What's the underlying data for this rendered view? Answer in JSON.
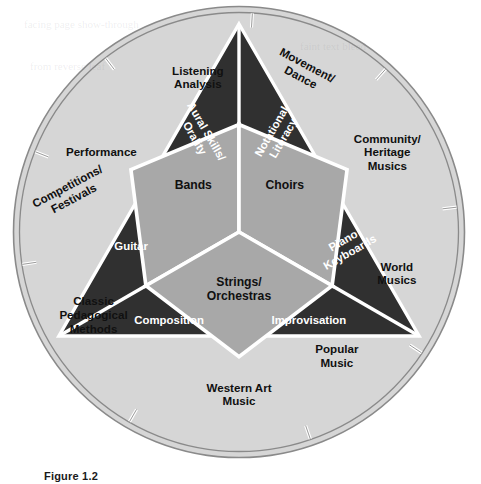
{
  "figure": {
    "caption": "Figure 1.2",
    "colors": {
      "outer_ring": "#d6d6d6",
      "inner_triangle": "#303030",
      "center": "#a8a8a8",
      "divider": "#ffffff",
      "rim": "#8a8a8a",
      "text_dark": "#101010",
      "text_light": "#ffffff",
      "background": "#ffffff"
    },
    "geometry": {
      "center_x": 239,
      "center_y": 232,
      "outer_radius": 227,
      "ring_inner_radius": 219,
      "triangle_radius": 208,
      "core_radius": 96
    },
    "outer_ring": {
      "name": "outer-ring",
      "segments": [
        {
          "id": "performance",
          "label": "Performance",
          "lines": [
            "Performance"
          ],
          "rotation": 0,
          "label_r": 0.7,
          "angle": -60
        },
        {
          "id": "listening-analysis",
          "label": "Listening Analysis",
          "lines": [
            "Listening",
            "Analysis"
          ],
          "rotation": 0,
          "label_r": 0.7,
          "angle": -15
        },
        {
          "id": "movement-dance",
          "label": "Movement/ Dance",
          "lines": [
            "Movement/",
            "Dance"
          ],
          "rotation": 28,
          "label_r": 0.76,
          "angle": 22
        },
        {
          "id": "community-heritage",
          "label": "Community/ Heritage Musics",
          "lines": [
            "Community/",
            "Heritage",
            "Musics"
          ],
          "rotation": 0,
          "label_r": 0.74,
          "angle": 62
        },
        {
          "id": "world-musics",
          "label": "World Musics",
          "lines": [
            "World",
            "Musics"
          ],
          "rotation": 0,
          "label_r": 0.72,
          "angle": 105
        },
        {
          "id": "popular-music",
          "label": "Popular Music",
          "lines": [
            "Popular",
            "Music"
          ],
          "rotation": 0,
          "label_r": 0.7,
          "angle": 142
        },
        {
          "id": "western-art-music",
          "label": "Western Art Music",
          "lines": [
            "Western Art",
            "Music"
          ],
          "rotation": 0,
          "label_r": 0.72,
          "angle": 180
        },
        {
          "id": "classic-pedagogy",
          "label": "Classic Pedagogical Methods",
          "lines": [
            "Classic",
            "Pedagogical",
            "Methods"
          ],
          "rotation": 0,
          "label_r": 0.74,
          "angle": 240
        },
        {
          "id": "competitions",
          "label": "Competitions/ Festivals",
          "lines": [
            "Competitions/",
            "Festivals"
          ],
          "rotation": -28,
          "label_r": 0.76,
          "angle": 283
        }
      ]
    },
    "inner_triangle": {
      "name": "inner-triangle",
      "segments": [
        {
          "id": "aural-skills-orality",
          "label": "Aural Skills/ Orality",
          "lines": [
            "Aural Skills/",
            "Orality"
          ],
          "rotation": 60
        },
        {
          "id": "notational-literacy",
          "label": "Notational Literacy",
          "lines": [
            "Notational",
            "Literacy"
          ],
          "rotation": -60
        },
        {
          "id": "piano-keyboards",
          "label": "Piano Keyboards",
          "lines": [
            "Piano",
            "Keyboards"
          ],
          "rotation": -30
        },
        {
          "id": "improvisation",
          "label": "Improvisation",
          "lines": [
            "Improvisation"
          ],
          "rotation": 0
        },
        {
          "id": "composition",
          "label": "Composition",
          "lines": [
            "Composition"
          ],
          "rotation": 0
        },
        {
          "id": "guitar",
          "label": "Guitar",
          "lines": [
            "Guitar"
          ],
          "rotation": 0
        }
      ]
    },
    "center": {
      "name": "center-core",
      "segments": [
        {
          "id": "bands",
          "label": "Bands",
          "lines": [
            "Bands"
          ]
        },
        {
          "id": "choirs",
          "label": "Choirs",
          "lines": [
            "Choirs"
          ]
        },
        {
          "id": "strings-orchestras",
          "label": "Strings/ Orchestras",
          "lines": [
            "Strings/",
            "Orchestras"
          ]
        }
      ]
    },
    "ghost_text": [
      {
        "text": "facing page show-through",
        "x": 24,
        "y": 18
      },
      {
        "text": "faint text bleed",
        "x": 300,
        "y": 40
      },
      {
        "text": "from reverse leaf",
        "x": 30,
        "y": 60
      }
    ]
  }
}
